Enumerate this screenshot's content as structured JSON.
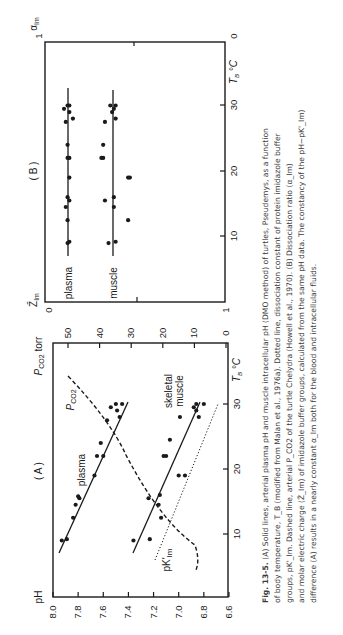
{
  "figure": {
    "id": "Fig. 13-5.",
    "orientation": "rotated 90° counter-clockwise on page",
    "caption_lines": [
      "(A) Solid lines, arterial plasma pH and muscle intracellular pH (DMO method) of turtles, Pseudemys, as a function",
      "of body temperature, T_B (modified from Malan et al., 1976a). Dotted line, dissociation constant of protein imidazole buffer",
      "groups, pK'_Im. Dashed line, arterial P_CO2 of the turtle Chelydra (Howell et al., 1970). (B) Dissociation ratio (α_Im)",
      "and molar electric charge (Z̄_Im) of imidazole buffer groups, calculated from the same pH data. The constancy of the pH−pK'_Im)",
      "difference (A) results in a nearly constant α_Im both for the blood and intracellular fluids."
    ]
  },
  "panelA": {
    "label": "( A )",
    "left_axis_label": "pH",
    "right_axis_label": "P_CO2 torr",
    "x_axis_label": "T_B °C",
    "series_labels": {
      "plasma": "plasma",
      "muscle_line1": "skeletal",
      "muscle_line2": "muscle",
      "pco2": "P_CO2",
      "pk": "pK'Im"
    }
  },
  "panelB": {
    "label": "( B )",
    "top_axis_label": "α Im",
    "bottom_axis_label": "Z̄ Im",
    "x_axis_label": "T_B °C",
    "series_labels": {
      "plasma": "plasma",
      "muscle": "muscle"
    },
    "top_ticks": [
      "1",
      "0"
    ],
    "bottom_ticks": [
      "0",
      "1"
    ]
  },
  "chart_data": [
    {
      "type": "scatter",
      "title": "(A) pH and P_CO2 vs body temperature",
      "xlabel": "T_B °C",
      "ylabel": "pH",
      "y2label": "P_CO2 torr",
      "xlim": [
        0,
        39
      ],
      "ylim": [
        6.6,
        8.0
      ],
      "y2lim": [
        0,
        50
      ],
      "x_ticks": [
        10,
        20,
        30
      ],
      "y_ticks": [
        8.0,
        7.8,
        7.6,
        7.4,
        7.2,
        7.0,
        6.8,
        6.6
      ],
      "y2_ticks": [
        50,
        40,
        30,
        20,
        10,
        0
      ],
      "series": [
        {
          "name": "plasma pH (points)",
          "style": "dots",
          "points": [
            [
              9,
              7.93
            ],
            [
              9.2,
              7.89
            ],
            [
              12.5,
              7.84
            ],
            [
              14.5,
              7.82
            ],
            [
              15.5,
              7.79
            ],
            [
              15.8,
              7.8
            ],
            [
              19,
              7.67
            ],
            [
              22,
              7.65
            ],
            [
              22,
              7.6
            ],
            [
              24,
              7.62
            ],
            [
              27.5,
              7.57
            ],
            [
              28,
              7.47
            ],
            [
              29,
              7.49
            ],
            [
              29.5,
              7.54
            ],
            [
              30,
              7.5
            ],
            [
              30,
              7.45
            ]
          ]
        },
        {
          "name": "plasma pH regression",
          "style": "solid",
          "points": [
            [
              7,
              7.95
            ],
            [
              35,
              7.4
            ]
          ]
        },
        {
          "name": "skeletal muscle pH (points)",
          "style": "dots",
          "points": [
            [
              9,
              7.36
            ],
            [
              9.2,
              7.23
            ],
            [
              12.5,
              7.14
            ],
            [
              14.5,
              7.16
            ],
            [
              15.5,
              7.24
            ],
            [
              16,
              7.15
            ],
            [
              19,
              7.0
            ],
            [
              19,
              6.95
            ],
            [
              22,
              7.12
            ],
            [
              22,
              7.1
            ],
            [
              24.5,
              7.07
            ],
            [
              28,
              6.99
            ],
            [
              28,
              6.84
            ],
            [
              29,
              6.86
            ],
            [
              29.5,
              6.88
            ],
            [
              30,
              6.86
            ],
            [
              30,
              6.8
            ]
          ]
        },
        {
          "name": "skeletal muscle pH regression",
          "style": "solid",
          "points": [
            [
              7,
              7.37
            ],
            [
              35,
              6.83
            ]
          ]
        },
        {
          "name": "pK'Im",
          "style": "dotted",
          "points": [
            [
              6,
              7.22
            ],
            [
              30,
              6.73
            ]
          ]
        },
        {
          "name": "arterial P_CO2 (Chelydra)",
          "style": "dashed",
          "axis": "y2",
          "points": [
            [
              5,
              9
            ],
            [
              8,
              10
            ],
            [
              12,
              13
            ],
            [
              16,
              17.5
            ],
            [
              20,
              22.5
            ],
            [
              24,
              28
            ],
            [
              28,
              35
            ],
            [
              32,
              42
            ],
            [
              35,
              48
            ]
          ]
        }
      ],
      "annotations": [
        "plasma",
        "skeletal muscle",
        "P_CO2",
        "pK'Im"
      ]
    },
    {
      "type": "scatter",
      "title": "(B) Dissociation ratio α_Im and molar charge Z̄_Im vs body temperature",
      "xlabel": "T_B °C",
      "ylabel": "α_Im (1 → 0) / Z̄_Im (0 → 1)",
      "xlim": [
        0,
        40
      ],
      "ylim": [
        0,
        1
      ],
      "x_ticks": [
        10,
        20,
        30
      ],
      "series": [
        {
          "name": "plasma",
          "style": "dots",
          "line_value": 0.11,
          "points": [
            [
              9,
              0.11
            ],
            [
              9.2,
              0.12
            ],
            [
              12.5,
              0.11
            ],
            [
              14.5,
              0.1
            ],
            [
              15.5,
              0.12
            ],
            [
              16,
              0.11
            ],
            [
              19,
              0.12
            ],
            [
              22,
              0.11
            ],
            [
              22,
              0.12
            ],
            [
              24,
              0.11
            ],
            [
              28,
              0.14
            ],
            [
              27.5,
              0.1
            ],
            [
              29,
              0.12
            ],
            [
              29.5,
              0.09
            ],
            [
              30,
              0.11
            ],
            [
              30,
              0.12
            ]
          ]
        },
        {
          "name": "muscle",
          "style": "dots",
          "line_value": 0.37,
          "points": [
            [
              9,
              0.34
            ],
            [
              9.2,
              0.38
            ],
            [
              12.5,
              0.45
            ],
            [
              14.5,
              0.37
            ],
            [
              15.5,
              0.32
            ],
            [
              16,
              0.37
            ],
            [
              19,
              0.45
            ],
            [
              19,
              0.46
            ],
            [
              22,
              0.3
            ],
            [
              22,
              0.31
            ],
            [
              24,
              0.31
            ],
            [
              27.5,
              0.32
            ],
            [
              28,
              0.38
            ],
            [
              29,
              0.36
            ],
            [
              29.5,
              0.37
            ],
            [
              30,
              0.35
            ],
            [
              30,
              0.38
            ]
          ]
        }
      ],
      "annotations": [
        "plasma",
        "muscle"
      ]
    }
  ]
}
